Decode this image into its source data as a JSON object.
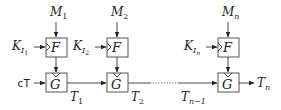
{
  "diagram": {
    "stages": [
      {
        "m_label": "M",
        "m_sub": "1",
        "k_label": "K",
        "k_sub": "I",
        "k_subsub": "1",
        "f_label": "F",
        "g_label": "G",
        "out_label": "T",
        "out_sub": "1"
      },
      {
        "m_label": "M",
        "m_sub": "2",
        "k_label": "K",
        "k_sub": "I",
        "k_subsub": "2",
        "f_label": "F",
        "g_label": "G",
        "out_label": "T",
        "out_sub": "2"
      },
      {
        "m_label": "M",
        "m_sub": "n",
        "k_label": "K",
        "k_sub": "I",
        "k_subsub": "n",
        "f_label": "F",
        "g_label": "G",
        "out_label": "T",
        "out_sub": "n"
      }
    ],
    "initial_input": "cT",
    "prev_label": "T",
    "prev_sub": "n−1"
  }
}
